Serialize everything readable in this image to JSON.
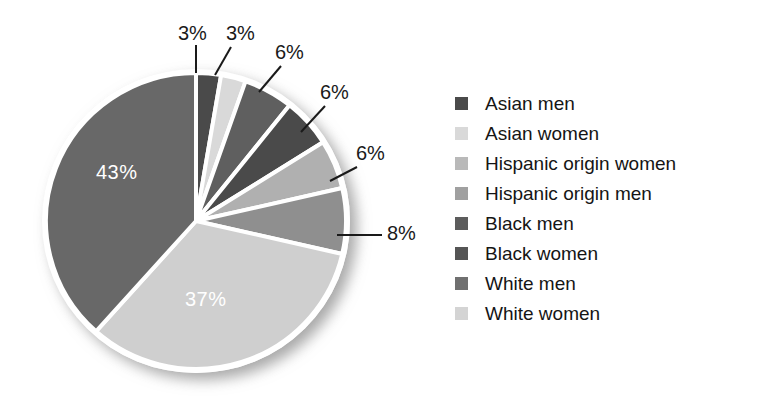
{
  "chart_data": {
    "type": "pie",
    "title": "",
    "subtitle": "",
    "xlabel": "",
    "ylabel": "",
    "legend_position": "right",
    "grid": false,
    "unit": "%",
    "categories": [
      "Asian men",
      "Asian women",
      "Hispanic origin women",
      "Hispanic origin men",
      "Black men",
      "Black women",
      "White men",
      "White women"
    ],
    "values": [
      3,
      3,
      6,
      6,
      6,
      8,
      37,
      43
    ],
    "value_labels": [
      "3%",
      "3%",
      "6%",
      "6%",
      "6%",
      "8%",
      "37%",
      "43%"
    ],
    "colors": [
      "#4a4a4a",
      "#d9d9d9",
      "#a3a3a3",
      "#9a9a9a",
      "#5a5a5a",
      "#4f4f4f",
      "#6e6e6e",
      "#d2d2d2"
    ],
    "slices": [
      {
        "label": "Asian men",
        "value": 3,
        "text": "3%",
        "color": "#4a4a4a",
        "label_placement": "callout"
      },
      {
        "label": "Asian women",
        "value": 3,
        "text": "3%",
        "color": "#d9d9d9",
        "label_placement": "callout"
      },
      {
        "label": "Hispanic origin women",
        "value": 6,
        "text": "6%",
        "color": "#5f5f5f",
        "label_placement": "callout"
      },
      {
        "label": "Hispanic origin men",
        "value": 6,
        "text": "6%",
        "color": "#4a4a4a",
        "label_placement": "callout"
      },
      {
        "label": "Black men",
        "value": 6,
        "text": "6%",
        "color": "#b0b0b0",
        "label_placement": "callout"
      },
      {
        "label": "Black women",
        "value": 8,
        "text": "8%",
        "color": "#8f8f8f",
        "label_placement": "callout"
      },
      {
        "label": "White men",
        "value": 37,
        "text": "37%",
        "color": "#cfcfcf",
        "label_placement": "inside"
      },
      {
        "label": "White women",
        "value": 43,
        "text": "43%",
        "color": "#686868",
        "label_placement": "inside"
      }
    ]
  },
  "pie": {
    "inner_labels": {
      "large_dark": "43%",
      "large_light": "37%"
    },
    "callouts": {
      "c1": "3%",
      "c2": "3%",
      "c3": "6%",
      "c4": "6%",
      "c5": "6%",
      "c6": "8%"
    }
  },
  "legend": {
    "items": [
      {
        "label": "Asian men",
        "color": "#4a4a4a"
      },
      {
        "label": "Asian women",
        "color": "#d9d9d9"
      },
      {
        "label": "Hispanic origin women",
        "color": "#b9b9b9"
      },
      {
        "label": "Hispanic origin men",
        "color": "#a0a0a0"
      },
      {
        "label": "Black men",
        "color": "#5c5c5c"
      },
      {
        "label": "Black women",
        "color": "#555555"
      },
      {
        "label": "White men",
        "color": "#707070"
      },
      {
        "label": "White women",
        "color": "#d4d4d4"
      }
    ]
  }
}
